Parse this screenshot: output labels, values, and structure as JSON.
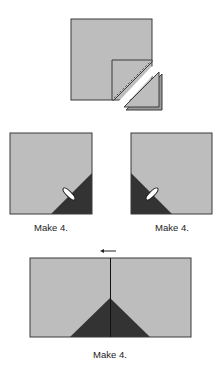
{
  "diagram": {
    "steps": [
      {
        "id": "step-1",
        "description": "Large light square with small square placed on corner, sewn on diagonal and trimmed; cut-off corner triangles shown separately"
      },
      {
        "id": "step-2-left",
        "caption": "Make 4.",
        "description": "Square with dark triangle in bottom-right corner, seam pressed"
      },
      {
        "id": "step-2-right",
        "caption": "Make 4.",
        "description": "Square with dark triangle in bottom-left corner, seam pressed"
      },
      {
        "id": "step-3",
        "caption": "Make 4.",
        "description": "Two units joined to form rectangle with dark triangle peak at center seam",
        "arrow_direction": "left"
      }
    ],
    "captions": {
      "middle_left": "Make 4.",
      "middle_right": "Make 4.",
      "bottom": "Make 4."
    },
    "colors": {
      "light_fabric": "#bdbdbd",
      "dark_fabric": "#333333",
      "outline": "#3a3a3a",
      "background": "#ffffff"
    }
  }
}
